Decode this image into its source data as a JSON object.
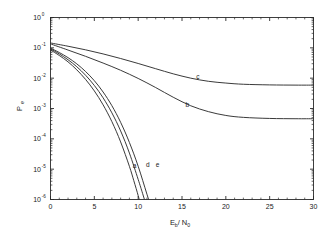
{
  "chart_data": {
    "type": "line",
    "title": "",
    "xlabel": "Eb/N0",
    "xlabel_parts": {
      "main1": "E",
      "sub1": "b",
      "slash": "/",
      "main2": "N",
      "sub2": "0"
    },
    "ylabel": "Pe",
    "ylabel_parts": {
      "main": "P",
      "sub": "e"
    },
    "xlim": [
      0,
      30
    ],
    "ylim": [
      1e-06,
      1
    ],
    "yscale": "log",
    "xscale": "linear",
    "grid": false,
    "legend": "none",
    "xticks": [
      0,
      5,
      10,
      15,
      20,
      25,
      30
    ],
    "xtick_labels": [
      "0",
      "5",
      "10",
      "15",
      "20",
      "25",
      "30"
    ],
    "yticks": [
      1,
      0.1,
      0.01,
      0.001,
      0.0001,
      1e-05,
      1e-06
    ],
    "ytick_labels": [
      "10^0",
      "10^-1",
      "10^-2",
      "10^-3",
      "10^-4",
      "10^-5",
      "10^-6"
    ],
    "ytick_label_parts": [
      {
        "base": "10",
        "exp": "0"
      },
      {
        "base": "10",
        "exp": "-1"
      },
      {
        "base": "10",
        "exp": "-2"
      },
      {
        "base": "10",
        "exp": "-3"
      },
      {
        "base": "10",
        "exp": "-4"
      },
      {
        "base": "10",
        "exp": "-5"
      },
      {
        "base": "10",
        "exp": "-6"
      }
    ],
    "annotations": [
      {
        "text": "a",
        "x": 9.6,
        "y": 1.1e-05
      },
      {
        "text": "b",
        "x": 15.6,
        "y": 0.00115
      },
      {
        "text": "c",
        "x": 16.8,
        "y": 0.0095
      },
      {
        "text": "d",
        "x": 11.1,
        "y": 1.15e-05
      },
      {
        "text": "e",
        "x": 12.2,
        "y": 1.2e-05
      }
    ],
    "series": [
      {
        "name": "a",
        "label": "a",
        "points": [
          [
            0,
            0.085
          ],
          [
            1,
            0.056
          ],
          [
            2,
            0.0345
          ],
          [
            3,
            0.0188
          ],
          [
            4,
            0.0091
          ],
          [
            5,
            0.0038
          ],
          [
            6,
            0.00132
          ],
          [
            7,
            0.00037
          ],
          [
            8,
            7.9e-05
          ],
          [
            9,
            1.24e-05
          ],
          [
            9.5,
            4.2e-06
          ],
          [
            10,
            1.35e-06
          ],
          [
            10.25,
            7e-07
          ],
          [
            10.5,
            3.3e-07
          ]
        ]
      },
      {
        "name": "b",
        "label": "b",
        "points": [
          [
            0,
            0.135
          ],
          [
            2,
            0.0845
          ],
          [
            4,
            0.0525
          ],
          [
            6,
            0.0315
          ],
          [
            8,
            0.0182
          ],
          [
            10,
            0.0098
          ],
          [
            12,
            0.0049
          ],
          [
            14,
            0.00235
          ],
          [
            16,
            0.00123
          ],
          [
            18,
            0.00079
          ],
          [
            20,
            0.00059
          ],
          [
            22,
            0.00051
          ],
          [
            25,
            0.00047
          ],
          [
            28,
            0.00046
          ],
          [
            30,
            0.00046
          ]
        ]
      },
      {
        "name": "c",
        "label": "c",
        "points": [
          [
            0,
            0.145
          ],
          [
            2,
            0.113
          ],
          [
            4,
            0.086
          ],
          [
            6,
            0.063
          ],
          [
            8,
            0.0445
          ],
          [
            10,
            0.0305
          ],
          [
            12,
            0.0205
          ],
          [
            14,
            0.0139
          ],
          [
            16,
            0.01
          ],
          [
            18,
            0.0079
          ],
          [
            20,
            0.0069
          ],
          [
            22,
            0.0063
          ],
          [
            25,
            0.006
          ],
          [
            28,
            0.0059
          ],
          [
            30,
            0.0059
          ]
        ]
      },
      {
        "name": "d",
        "label": "d",
        "points": [
          [
            0,
            0.092
          ],
          [
            1,
            0.063
          ],
          [
            2,
            0.0405
          ],
          [
            3,
            0.0238
          ],
          [
            4,
            0.0125
          ],
          [
            5,
            0.00575
          ],
          [
            6,
            0.00225
          ],
          [
            7,
            0.00072
          ],
          [
            8,
            0.000182
          ],
          [
            9,
            3.4e-05
          ],
          [
            10,
            4.6e-06
          ],
          [
            10.5,
            1.6e-06
          ],
          [
            11,
            5.4e-07
          ],
          [
            11.5,
            1.9e-07
          ],
          [
            11.8,
            1e-07
          ]
        ]
      },
      {
        "name": "e",
        "label": "e",
        "points": [
          [
            0,
            0.098
          ],
          [
            1,
            0.07
          ],
          [
            2,
            0.0475
          ],
          [
            3,
            0.0296
          ],
          [
            4,
            0.0166
          ],
          [
            5,
            0.00825
          ],
          [
            6,
            0.0035
          ],
          [
            7,
            0.00124
          ],
          [
            8,
            0.00035
          ],
          [
            9,
            7.6e-05
          ],
          [
            10,
            1.25e-05
          ],
          [
            11,
            1.5e-06
          ],
          [
            11.7,
            3.4e-07
          ],
          [
            12.3,
            1.2e-07
          ],
          [
            12.8,
            5e-08
          ]
        ]
      }
    ]
  },
  "figure": {
    "background_color": "#ffffff",
    "axis_color": "#2a2a2a",
    "curve_color": "#2f2f2f"
  }
}
